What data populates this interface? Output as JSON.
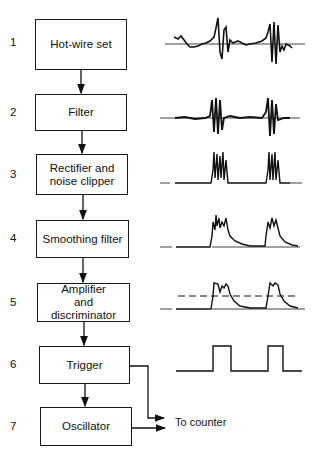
{
  "diagram": {
    "stages": [
      {
        "number": "1",
        "label": "Hot-wire set"
      },
      {
        "number": "2",
        "label": "Filter"
      },
      {
        "number": "3",
        "label": "Rectifier and noise clipper"
      },
      {
        "number": "4",
        "label": "Smoothing filter"
      },
      {
        "number": "5",
        "label": "Amplifier and discriminator"
      },
      {
        "number": "6",
        "label": "Trigger"
      },
      {
        "number": "7",
        "label": "Oscillator"
      }
    ],
    "output_label": "To counter",
    "waveforms": [
      {
        "stage": "1",
        "description": "raw hot-wire signal with two bursts"
      },
      {
        "stage": "2",
        "description": "filtered oscillating bursts"
      },
      {
        "stage": "3",
        "description": "rectified clipped spikes"
      },
      {
        "stage": "4",
        "description": "smoothed envelope pulses"
      },
      {
        "stage": "5",
        "description": "amplified pulses with discriminator threshold (dashed)"
      },
      {
        "stage": "6",
        "description": "square trigger pulses"
      }
    ]
  }
}
